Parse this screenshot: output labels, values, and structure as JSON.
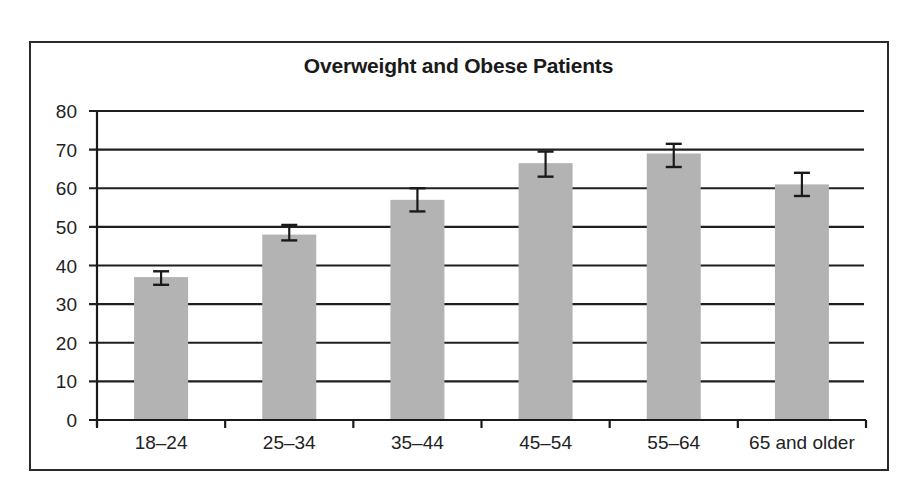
{
  "chart_data": {
    "type": "bar",
    "title": "Overweight and Obese Patients",
    "xlabel": "",
    "ylabel": "",
    "categories": [
      "18–24",
      "25–34",
      "35–44",
      "45–54",
      "55–64",
      "65 and older"
    ],
    "values": [
      37,
      48,
      57,
      66.5,
      69,
      61
    ],
    "error_bars": [
      {
        "low": 35,
        "high": 38.5
      },
      {
        "low": 46.5,
        "high": 50.5
      },
      {
        "low": 54,
        "high": 60
      },
      {
        "low": 63,
        "high": 69.5
      },
      {
        "low": 65.5,
        "high": 71.5
      },
      {
        "low": 58,
        "high": 64
      }
    ],
    "ylim": [
      0,
      80
    ],
    "yticks": [
      0,
      10,
      20,
      30,
      40,
      50,
      60,
      70,
      80
    ],
    "grid": true,
    "legend": null,
    "bar_color": "#b3b3b3",
    "grid_color": "#1f1f1f"
  }
}
